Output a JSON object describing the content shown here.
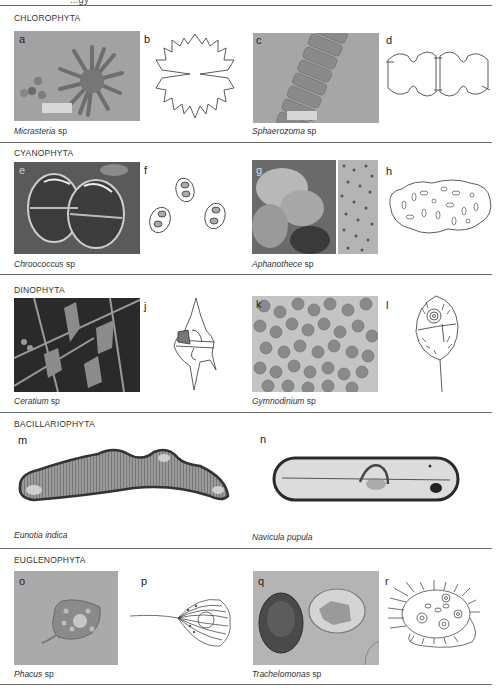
{
  "figure": {
    "top_cut_text": "...gy",
    "sections": [
      {
        "title": "CHLOROPHYTA",
        "panels": [
          {
            "letter": "a",
            "type": "micrograph",
            "genus": "Micrasteria",
            "suffix": "sp"
          },
          {
            "letter": "b",
            "type": "drawing"
          },
          {
            "letter": "c",
            "type": "micrograph",
            "genus": "Sphaerozoma",
            "suffix": "sp"
          },
          {
            "letter": "d",
            "type": "drawing"
          }
        ]
      },
      {
        "title": "CYANOPHYTA",
        "panels": [
          {
            "letter": "e",
            "type": "micrograph",
            "genus": "Chroococcus",
            "suffix": "sp"
          },
          {
            "letter": "f",
            "type": "drawing"
          },
          {
            "letter": "g",
            "type": "micrograph",
            "genus": "Aphanothece",
            "suffix": "sp"
          },
          {
            "letter": "h",
            "type": "drawing"
          }
        ]
      },
      {
        "title": "DINOPHYTA",
        "panels": [
          {
            "letter": "i",
            "type": "micrograph",
            "genus": "Ceratium",
            "suffix": "sp"
          },
          {
            "letter": "j",
            "type": "drawing"
          },
          {
            "letter": "k",
            "type": "micrograph",
            "genus": "Gymnodinium",
            "suffix": "sp"
          },
          {
            "letter": "l",
            "type": "drawing"
          }
        ]
      },
      {
        "title": "BACILLARIOPHYTA",
        "panels": [
          {
            "letter": "m",
            "type": "micrograph",
            "genus": "Eunotia indica",
            "suffix": ""
          },
          {
            "letter": "n",
            "type": "micrograph",
            "genus": "Navicula pupula",
            "suffix": ""
          }
        ]
      },
      {
        "title": "EUGLENOPHYTA",
        "panels": [
          {
            "letter": "o",
            "type": "micrograph",
            "genus": "Phacus",
            "suffix": "sp"
          },
          {
            "letter": "p",
            "type": "drawing"
          },
          {
            "letter": "q",
            "type": "micrograph",
            "genus": "Trachelomonas",
            "suffix": "sp"
          },
          {
            "letter": "r",
            "type": "drawing"
          }
        ]
      }
    ],
    "colors": {
      "rule": "#6a6a6a",
      "photo_gray": "#9a9a9a",
      "photo_dark": "#2e2e2e",
      "ink": "#333333"
    }
  }
}
